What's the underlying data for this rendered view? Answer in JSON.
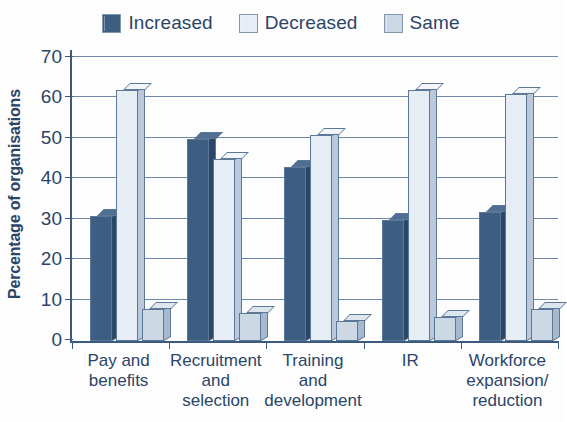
{
  "chart_data": {
    "type": "bar",
    "title": "",
    "xlabel": "",
    "ylabel": "Percentage of organisations",
    "ylim": [
      0,
      70
    ],
    "ytick_step": 10,
    "yticks": [
      "70",
      "60",
      "50",
      "40",
      "30",
      "20",
      "10",
      "0"
    ],
    "grid": true,
    "legend_position": "top-center",
    "categories": [
      "Pay and benefits",
      "Recruitment and selection",
      "Training and development",
      "IR",
      "Workforce expansion/ reduction"
    ],
    "category_lines": [
      [
        "Pay and",
        "benefits"
      ],
      [
        "Recruitment",
        "and",
        "selection"
      ],
      [
        "Training",
        "and",
        "development"
      ],
      [
        "IR"
      ],
      [
        "Workforce",
        "expansion/",
        "reduction"
      ]
    ],
    "series": [
      {
        "name": "Increased",
        "color": "#3d5d83",
        "values": [
          31,
          50,
          43,
          30,
          32
        ]
      },
      {
        "name": "Decreased",
        "color": "#e6edf5",
        "values": [
          62,
          45,
          51,
          62,
          61
        ]
      },
      {
        "name": "Same",
        "color": "#ccd8e4",
        "values": [
          8,
          7,
          5,
          6,
          8
        ]
      }
    ]
  },
  "legend": {
    "items": [
      {
        "label": "Increased",
        "color": "#3d5d83"
      },
      {
        "label": "Decreased",
        "color": "#e6edf5"
      },
      {
        "label": "Same",
        "color": "#ccd8e4"
      }
    ]
  },
  "axes": {
    "y_title": "Percentage of organisations"
  }
}
